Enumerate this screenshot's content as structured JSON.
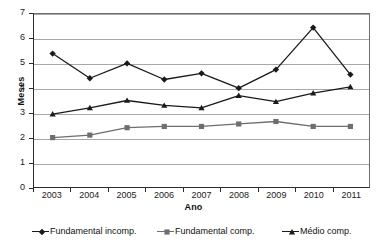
{
  "chart": {
    "title": "",
    "ylabel": "Meses",
    "xlabel": "Ano"
  },
  "chart_data": {
    "type": "line",
    "title": "",
    "xlabel": "Ano",
    "ylabel": "Meses",
    "ylim": [
      0,
      7
    ],
    "yticks": [
      "0",
      "1",
      "2",
      "3",
      "4",
      "5",
      "6",
      "7"
    ],
    "grid": true,
    "legend_position": "bottom",
    "categories": [
      "2003",
      "2004",
      "2005",
      "2006",
      "2007",
      "2008",
      "2009",
      "2010",
      "2011"
    ],
    "series": [
      {
        "name": "Fundamental incomp.",
        "marker": "diamond",
        "color": "#1a1a1a",
        "values": [
          5.4,
          4.4,
          5.0,
          4.35,
          4.6,
          4.0,
          4.75,
          6.45,
          4.55
        ]
      },
      {
        "name": "Fundamental comp.",
        "marker": "square",
        "color": "#6e6e6e",
        "values": [
          2.0,
          2.1,
          2.4,
          2.45,
          2.45,
          2.55,
          2.65,
          2.45,
          2.45
        ]
      },
      {
        "name": "Médio comp.",
        "marker": "triangle",
        "color": "#1a1a1a",
        "values": [
          2.95,
          3.2,
          3.5,
          3.3,
          3.2,
          3.7,
          3.45,
          3.8,
          4.05
        ]
      }
    ]
  }
}
